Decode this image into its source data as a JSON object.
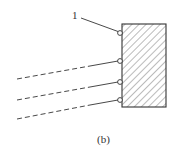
{
  "diagram": {
    "caption": "(b)",
    "callout_label": "1",
    "colors": {
      "stroke": "#333333",
      "hatch": "#555555",
      "background": "#ffffff"
    },
    "block": {
      "x": 122,
      "y": 24,
      "width": 44,
      "height": 83,
      "fill": "diagonal-hatch"
    },
    "leader_line": {
      "x1": 81,
      "y1": 18,
      "x2": 119,
      "y2": 32
    },
    "nodes": [
      {
        "id": "node-1",
        "cx": 120,
        "cy": 33
      },
      {
        "id": "node-2",
        "cx": 120,
        "cy": 61
      },
      {
        "id": "node-3",
        "cx": 120,
        "cy": 82
      },
      {
        "id": "node-4",
        "cx": 120,
        "cy": 100
      }
    ],
    "lines": [
      {
        "dashed": {
          "x1": 17,
          "y1": 79,
          "x2": 90,
          "y2": 66
        },
        "solid": {
          "x1": 90,
          "y1": 66,
          "x2": 118,
          "y2": 61
        }
      },
      {
        "dashed": {
          "x1": 17,
          "y1": 100,
          "x2": 90,
          "y2": 87
        },
        "solid": {
          "x1": 90,
          "y1": 87,
          "x2": 118,
          "y2": 82
        }
      },
      {
        "dashed": {
          "x1": 17,
          "y1": 119,
          "x2": 90,
          "y2": 105
        },
        "solid": {
          "x1": 90,
          "y1": 105,
          "x2": 118,
          "y2": 100
        }
      }
    ]
  }
}
